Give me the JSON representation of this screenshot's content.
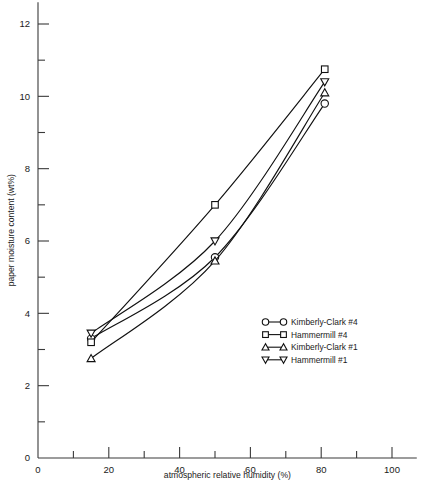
{
  "chart_data": {
    "type": "line",
    "title": "",
    "xlabel": "atmospheric relative humidity (%)",
    "ylabel": "paper moisture content (wt%)",
    "xlim": [
      0,
      107
    ],
    "ylim": [
      0,
      12.6
    ],
    "grid": false,
    "legend_position": "center-right-inside",
    "x_major_ticks": [
      0,
      20,
      40,
      60,
      80,
      100
    ],
    "x_major_tick_labels": [
      "0",
      "20",
      "40",
      "60",
      "80",
      "100"
    ],
    "x_minor_ticks": [
      10,
      30,
      50,
      70,
      90
    ],
    "y_major_ticks": [
      0,
      2,
      4,
      6,
      8,
      10,
      12
    ],
    "y_major_tick_labels": [
      "0",
      "2",
      "4",
      "6",
      "8",
      "10",
      "12"
    ],
    "y_minor_ticks": [
      1,
      3,
      5,
      7,
      9,
      11
    ],
    "series": [
      {
        "name": "Kimberly-Clark #4",
        "marker": "circle",
        "x": [
          15.0,
          50.0,
          81.0
        ],
        "y": [
          3.3,
          5.55,
          9.8
        ]
      },
      {
        "name": "Hammermill #4",
        "marker": "square",
        "x": [
          15.0,
          50.0,
          81.0
        ],
        "y": [
          3.2,
          7.0,
          10.75
        ]
      },
      {
        "name": "Kimberly-Clark #1",
        "marker": "triangle-up",
        "x": [
          15.0,
          50.0,
          81.0
        ],
        "y": [
          2.75,
          5.45,
          10.1
        ]
      },
      {
        "name": "Hammermill #1",
        "marker": "triangle-down",
        "x": [
          15.0,
          50.0,
          81.0
        ],
        "y": [
          3.45,
          6.0,
          10.4
        ]
      }
    ]
  },
  "legend": {
    "entries": [
      {
        "label": "Kimberly-Clark #4",
        "marker": "circle"
      },
      {
        "label": "Hammermill #4",
        "marker": "square"
      },
      {
        "label": "Kimberly-Clark #1",
        "marker": "triangle-up"
      },
      {
        "label": "Hammermill #1",
        "marker": "triangle-down"
      }
    ]
  }
}
